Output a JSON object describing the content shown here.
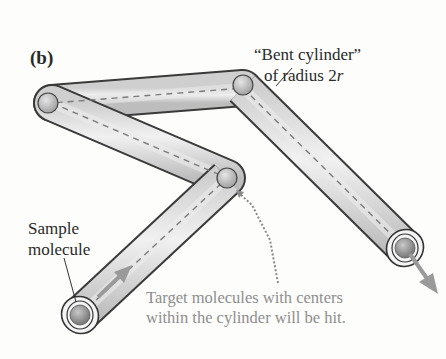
{
  "figure": {
    "panel_label": "(b)",
    "annotations": {
      "bent_cylinder_line1": "“Bent cylinder”",
      "bent_cylinder_line2_prefix": "of radius 2",
      "bent_cylinder_line2_var": "r",
      "sample_line1": "Sample",
      "sample_line2": "molecule",
      "target_line1": "Target molecules with centers",
      "target_line2": "within the cylinder will be hit."
    },
    "colors": {
      "background": "#fdfdfb",
      "tube_fill": "#d9d9d9",
      "tube_outline": "#3a3a3a",
      "sphere_fill": "#bdbdbd",
      "arrow": "#9a9a9a",
      "dashed_path": "#777777",
      "caption_gray": "#8e8e8e"
    },
    "path_vertices": [
      {
        "name": "start",
        "x": 80,
        "y": 315
      },
      {
        "name": "middle-collision",
        "x": 227,
        "y": 178
      },
      {
        "name": "left-collision",
        "x": 48,
        "y": 103
      },
      {
        "name": "top-collision",
        "x": 243,
        "y": 85
      },
      {
        "name": "end",
        "x": 405,
        "y": 248
      }
    ]
  }
}
